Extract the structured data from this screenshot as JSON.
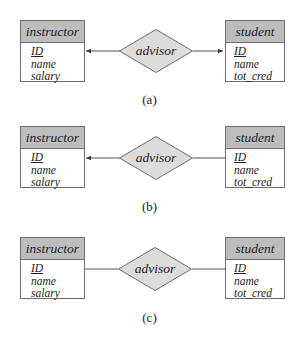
{
  "diagrams": [
    {
      "caption": "(a)",
      "left_entity": {
        "name": "instructor",
        "attributes": [
          {
            "name": "ID",
            "primary_key": true
          },
          {
            "name": "name"
          },
          {
            "name": "salary"
          }
        ]
      },
      "relationship": "advisor",
      "right_entity": {
        "name": "student",
        "attributes": [
          {
            "name": "ID",
            "primary_key": true
          },
          {
            "name": "name"
          },
          {
            "name": "tot_cred"
          }
        ]
      },
      "left_connector": "arrow",
      "right_connector": "arrow"
    },
    {
      "caption": "(b)",
      "left_entity": {
        "name": "instructor",
        "attributes": [
          {
            "name": "ID",
            "primary_key": true
          },
          {
            "name": "name"
          },
          {
            "name": "salary"
          }
        ]
      },
      "relationship": "advisor",
      "right_entity": {
        "name": "student",
        "attributes": [
          {
            "name": "ID",
            "primary_key": true
          },
          {
            "name": "name"
          },
          {
            "name": "tot_cred"
          }
        ]
      },
      "left_connector": "arrow",
      "right_connector": "line"
    },
    {
      "caption": "(c)",
      "left_entity": {
        "name": "instructor",
        "attributes": [
          {
            "name": "ID",
            "primary_key": true
          },
          {
            "name": "name"
          },
          {
            "name": "salary"
          }
        ]
      },
      "relationship": "advisor",
      "right_entity": {
        "name": "student",
        "attributes": [
          {
            "name": "ID",
            "primary_key": true
          },
          {
            "name": "name"
          },
          {
            "name": "tot_cred"
          }
        ]
      },
      "left_connector": "line",
      "right_connector": "line"
    }
  ],
  "colors": {
    "entity_header": "#bdbdbd",
    "diamond_fill": "#dcdcdc",
    "stroke": "#6e6e6e"
  }
}
